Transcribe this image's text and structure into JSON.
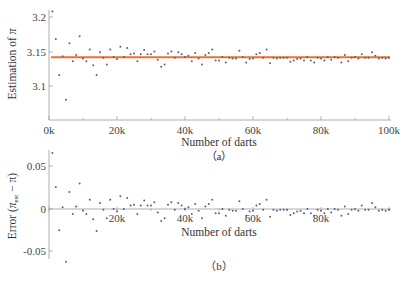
{
  "chart_data": [
    {
      "type": "scatter",
      "panel": "(a)",
      "title": "",
      "xlabel": "Number of darts",
      "ylabel": "Estimation of π",
      "xlim": [
        0,
        100000
      ],
      "ylim": [
        3.055,
        3.215
      ],
      "x_ticks": [
        "0k",
        "20k",
        "40k",
        "60k",
        "80k",
        "100k"
      ],
      "y_ticks": [
        "3.1",
        "3.15",
        "3.2"
      ],
      "grid": false,
      "reference_line": {
        "label": "π",
        "value": 3.14159,
        "color": "#e8732a"
      },
      "point_color": "#5a5f8a",
      "x": [
        1000,
        2000,
        3000,
        4000,
        5000,
        6000,
        7000,
        8000,
        9000,
        10000,
        11000,
        12000,
        13000,
        14000,
        15000,
        16000,
        17000,
        18000,
        19000,
        20000,
        21000,
        22000,
        23000,
        24000,
        25000,
        26000,
        27000,
        28000,
        29000,
        30000,
        31000,
        32000,
        33000,
        34000,
        35000,
        36000,
        37000,
        38000,
        39000,
        40000,
        41000,
        42000,
        43000,
        44000,
        45000,
        46000,
        47000,
        48000,
        49000,
        50000,
        51000,
        52000,
        53000,
        54000,
        55000,
        56000,
        57000,
        58000,
        59000,
        60000,
        61000,
        62000,
        63000,
        64000,
        65000,
        66000,
        67000,
        68000,
        69000,
        70000,
        71000,
        72000,
        73000,
        74000,
        75000,
        76000,
        77000,
        78000,
        79000,
        80000,
        81000,
        82000,
        83000,
        84000,
        85000,
        86000,
        87000,
        88000,
        89000,
        90000,
        91000,
        92000,
        93000,
        94000,
        95000,
        96000,
        97000,
        98000,
        99000,
        100000
      ],
      "values": [
        3.208,
        3.168,
        3.116,
        3.143,
        3.08,
        3.162,
        3.136,
        3.145,
        3.172,
        3.14,
        3.136,
        3.153,
        3.13,
        3.116,
        3.149,
        3.141,
        3.131,
        3.153,
        3.142,
        3.139,
        3.157,
        3.142,
        3.155,
        3.146,
        3.147,
        3.136,
        3.146,
        3.152,
        3.146,
        3.146,
        3.15,
        3.138,
        3.128,
        3.131,
        3.147,
        3.15,
        3.141,
        3.149,
        3.146,
        3.142,
        3.144,
        3.136,
        3.148,
        3.14,
        3.131,
        3.145,
        3.148,
        3.153,
        3.137,
        3.137,
        3.142,
        3.134,
        3.141,
        3.14,
        3.14,
        3.151,
        3.142,
        3.134,
        3.139,
        3.14,
        3.146,
        3.148,
        3.141,
        3.153,
        3.133,
        3.141,
        3.14,
        3.141,
        3.141,
        3.141,
        3.135,
        3.137,
        3.139,
        3.14,
        3.137,
        3.142,
        3.137,
        3.134,
        3.141,
        3.14,
        3.137,
        3.142,
        3.138,
        3.142,
        3.141,
        3.134,
        3.145,
        3.136,
        3.141,
        3.142,
        3.14,
        3.146,
        3.141,
        3.141,
        3.149,
        3.144,
        3.14,
        3.141,
        3.14,
        3.141
      ]
    },
    {
      "type": "scatter",
      "panel": "(b)",
      "title": "",
      "xlabel": "Number of darts",
      "ylabel": "Error (π_est − π)",
      "xlim": [
        0,
        100000
      ],
      "ylim": [
        -0.063,
        0.07
      ],
      "x_ticks": [
        "20k",
        "40k",
        "60k",
        "80k"
      ],
      "y_ticks": [
        "-0.05",
        "0",
        "0.05"
      ],
      "grid": false,
      "point_color": "#5a5f8a",
      "x": [
        1000,
        2000,
        3000,
        4000,
        5000,
        6000,
        7000,
        8000,
        9000,
        10000,
        11000,
        12000,
        13000,
        14000,
        15000,
        16000,
        17000,
        18000,
        19000,
        20000,
        21000,
        22000,
        23000,
        24000,
        25000,
        26000,
        27000,
        28000,
        29000,
        30000,
        31000,
        32000,
        33000,
        34000,
        35000,
        36000,
        37000,
        38000,
        39000,
        40000,
        41000,
        42000,
        43000,
        44000,
        45000,
        46000,
        47000,
        48000,
        49000,
        50000,
        51000,
        52000,
        53000,
        54000,
        55000,
        56000,
        57000,
        58000,
        59000,
        60000,
        61000,
        62000,
        63000,
        64000,
        65000,
        66000,
        67000,
        68000,
        69000,
        70000,
        71000,
        72000,
        73000,
        74000,
        75000,
        76000,
        77000,
        78000,
        79000,
        80000,
        81000,
        82000,
        83000,
        84000,
        85000,
        86000,
        87000,
        88000,
        89000,
        90000,
        91000,
        92000,
        93000,
        94000,
        95000,
        96000,
        97000,
        98000,
        99000,
        100000
      ],
      "values": [
        0.066,
        0.026,
        -0.025,
        0.002,
        -0.062,
        0.02,
        -0.006,
        0.003,
        0.03,
        -0.002,
        -0.006,
        0.011,
        -0.012,
        -0.026,
        0.007,
        -0.001,
        -0.011,
        0.011,
        0.0,
        -0.003,
        0.015,
        0.0,
        0.013,
        0.004,
        0.005,
        -0.006,
        0.004,
        0.01,
        0.004,
        0.004,
        0.008,
        -0.004,
        -0.014,
        -0.011,
        0.005,
        0.008,
        -0.001,
        0.007,
        0.004,
        0.0,
        0.002,
        -0.006,
        0.006,
        -0.002,
        -0.011,
        0.003,
        0.006,
        0.011,
        -0.005,
        -0.005,
        0.0,
        -0.008,
        -0.001,
        -0.002,
        -0.002,
        0.009,
        0.0,
        -0.008,
        -0.003,
        -0.002,
        0.004,
        0.006,
        -0.001,
        0.011,
        -0.009,
        -0.001,
        -0.002,
        -0.001,
        -0.001,
        -0.001,
        -0.007,
        -0.005,
        -0.003,
        -0.002,
        -0.005,
        0.0,
        -0.005,
        -0.008,
        -0.001,
        -0.002,
        -0.005,
        0.0,
        -0.004,
        0.0,
        -0.001,
        -0.008,
        0.003,
        -0.006,
        -0.001,
        0.0,
        -0.002,
        0.004,
        -0.001,
        -0.001,
        0.007,
        0.002,
        -0.002,
        -0.001,
        -0.002,
        -0.001
      ]
    }
  ],
  "top": {
    "ylabel_text": "Estimation of ",
    "ylabel_symbol": "π",
    "xlabel": "Number of darts",
    "caption": "（a）",
    "x_ticks": [
      "0k",
      "20k",
      "40k",
      "60k",
      "80k",
      "100k"
    ],
    "y_ticks": [
      "3.2",
      "3.15",
      "3.1"
    ]
  },
  "bottom": {
    "ylabel_text": "Error (",
    "ylabel_sym": "π",
    "ylabel_sub": "est",
    "ylabel_rest": " − π)",
    "xlabel": "Number of darts",
    "caption": "（b）",
    "x_ticks": [
      "20k",
      "40k",
      "60k",
      "80k"
    ],
    "y_ticks": [
      "0.05",
      "0",
      "-0.05"
    ]
  }
}
